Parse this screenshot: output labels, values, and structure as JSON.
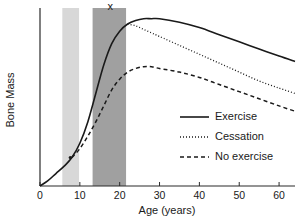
{
  "chart_data": {
    "type": "line",
    "title": "",
    "xlabel": "Age (years)",
    "ylabel": "Bone Mass",
    "xlim": [
      0,
      64
    ],
    "ylim": [
      0,
      100
    ],
    "grid": false,
    "x_ticks": [
      0,
      10,
      20,
      30,
      40,
      50,
      60
    ],
    "x_tick_labels": [
      "0",
      "10",
      "20",
      "30",
      "40",
      "50",
      "60"
    ],
    "y_ticks": [],
    "y_tick_labels": [],
    "legend_position": "center-right",
    "series": [
      {
        "name": "Exercise",
        "style": "solid",
        "color": "#1a1a1a",
        "x": [
          0,
          2,
          4,
          6,
          8,
          10,
          12,
          14,
          16,
          18,
          20,
          22,
          24,
          26,
          28,
          30,
          35,
          40,
          45,
          50,
          55,
          60,
          64
        ],
        "y": [
          0,
          3,
          7,
          11,
          16,
          24,
          36,
          52,
          68,
          80,
          87,
          91,
          93,
          94,
          94,
          94,
          92,
          89,
          85,
          81,
          77,
          73,
          70
        ]
      },
      {
        "name": "Cessation",
        "style": "dotted",
        "color": "#1a1a1a",
        "x": [
          22,
          24,
          26,
          28,
          30,
          35,
          40,
          45,
          50,
          55,
          60,
          64
        ],
        "y": [
          91,
          90,
          88,
          86,
          84,
          79,
          74,
          69,
          64,
          59,
          55,
          52
        ]
      },
      {
        "name": "No exercise",
        "style": "dashed",
        "color": "#1a1a1a",
        "x": [
          8,
          10,
          12,
          14,
          16,
          18,
          20,
          22,
          24,
          26,
          28,
          30,
          35,
          40,
          45,
          50,
          55,
          60,
          64
        ],
        "y": [
          16,
          21,
          28,
          36,
          45,
          54,
          60,
          64,
          66,
          67,
          67,
          66,
          64,
          61,
          57,
          53,
          49,
          45,
          42
        ]
      }
    ],
    "shaded_bands": [
      {
        "name": "light-band",
        "x_start": 5.6,
        "x_end": 9.8,
        "color": "#d8d8d8",
        "label": ""
      },
      {
        "name": "dark-band",
        "x_start": 13.2,
        "x_end": 21.6,
        "color": "#a0a0a0",
        "label": "x"
      }
    ],
    "annotations": [
      {
        "name": "peak-bone-mass-marker",
        "text": "x",
        "x": 17.6,
        "y": 99
      },
      {
        "name": "divergence-dot",
        "text": "",
        "x": 7.6,
        "y": 16
      }
    ]
  },
  "legend": {
    "items": [
      {
        "label": "Exercise",
        "style": "solid"
      },
      {
        "label": "Cessation",
        "style": "dotted"
      },
      {
        "label": "No exercise",
        "style": "dashed"
      }
    ]
  },
  "axes": {
    "x_title": "Age (years)",
    "y_title": "Bone Mass"
  }
}
